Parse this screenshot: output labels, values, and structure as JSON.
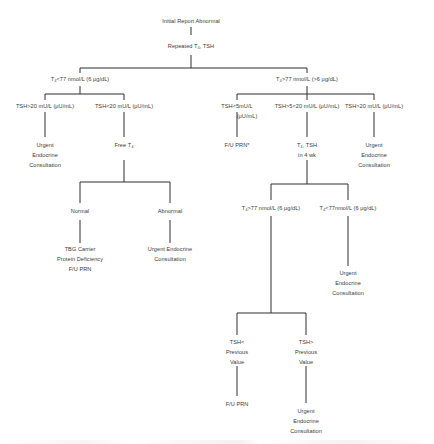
{
  "diagram": {
    "type": "flowchart",
    "nodes": {
      "root": {
        "lines": [
          "Initial Report Abnormal"
        ]
      },
      "repeat": {
        "lines": [
          "Repeated T₄, TSH"
        ]
      },
      "left_branch": {
        "lines": [
          "T₄<77 nmol/L (6 μg/dL)"
        ]
      },
      "right_branch": {
        "lines": [
          "T₄>77 nmol/L (>6 μg/dL)"
        ]
      },
      "l_tsh_high": {
        "lines": [
          "TSH>20 mU/L (μU/mL)"
        ]
      },
      "l_tsh_low": {
        "lines": [
          "TSH<20 mU/L (μU/mL)"
        ]
      },
      "l_urgent": {
        "lines": [
          "Urgent",
          "Endocrine",
          "Consultation"
        ]
      },
      "free_t4": {
        "lines": [
          "Free T₄"
        ]
      },
      "normal": {
        "lines": [
          "Normal"
        ]
      },
      "abnormal": {
        "lines": [
          "Abnormal"
        ]
      },
      "tbg": {
        "lines": [
          "TBG Carrier",
          "Protein Deficiency",
          "F/U PRN"
        ]
      },
      "abn_urgent": {
        "lines": [
          "Urgent Endocrine",
          "Consultation"
        ]
      },
      "r_tsh_lt5": {
        "lines": [
          "TSH<5mU/L",
          "(μU/mL)"
        ]
      },
      "r_tsh_5_20": {
        "lines": [
          "TSH>5<20 mU/L (μU/mL)"
        ]
      },
      "r_tsh_gt20": {
        "lines": [
          "TSH>20 mU/L (μU/mL)"
        ]
      },
      "fu_prn_star": {
        "lines": [
          "F/U PRN*"
        ]
      },
      "t4tsh_4wk": {
        "lines": [
          "T₄, TSH",
          "in 4 wk"
        ]
      },
      "r_urgent": {
        "lines": [
          "Urgent",
          "Endocrine",
          "Consultation"
        ]
      },
      "t4_gt77": {
        "lines": [
          "T₄>77 nmol/L (6 μg/dL)"
        ]
      },
      "t4_lt77": {
        "lines": [
          "T₄<77nmol/L (6 μg/dL)"
        ]
      },
      "t4lt_urgent": {
        "lines": [
          "Urgent",
          "Endocrine",
          "Consultation"
        ]
      },
      "tsh_lt_prev": {
        "lines": [
          "TSH<",
          "Previous",
          "Value"
        ]
      },
      "tsh_gt_prev": {
        "lines": [
          "TSH>",
          "Previous",
          "Value"
        ]
      },
      "fu_prn": {
        "lines": [
          "F/U PRN"
        ]
      },
      "prev_urgent": {
        "lines": [
          "Urgent",
          "Endocrine",
          "Consultation"
        ]
      }
    },
    "colors": {
      "line": "#2e2e2e",
      "text": "#3a3a3a",
      "background": "#ffffff"
    }
  }
}
